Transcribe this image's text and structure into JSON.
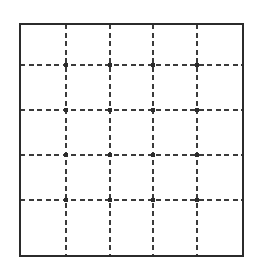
{
  "figure": {
    "kind": "dashed-grid-square",
    "canvas": {
      "width": 260,
      "height": 271,
      "background_color": "#ffffff"
    },
    "frame": {
      "name": "outer-square",
      "x": 20,
      "y": 24,
      "width": 223,
      "height": 232,
      "stroke_color": "#2b2b2b",
      "stroke_width": 2,
      "fill_color": "#ffffff",
      "line_style": "solid"
    },
    "grid": {
      "stroke_color": "#3a3a3a",
      "stroke_width": 1.6,
      "line_style": "dashed",
      "dash_length": 5,
      "dash_gap": 3.5,
      "columns": 5,
      "rows": 5,
      "vertical_lines": [
        {
          "name": "v-line-1",
          "x": 66
        },
        {
          "name": "v-line-2",
          "x": 110
        },
        {
          "name": "v-line-3",
          "x": 153
        },
        {
          "name": "v-line-4",
          "x": 197
        }
      ],
      "horizontal_lines": [
        {
          "name": "h-line-1",
          "y": 65
        },
        {
          "name": "h-line-2",
          "y": 110
        },
        {
          "name": "h-line-3",
          "y": 155
        },
        {
          "name": "h-line-4",
          "y": 200
        }
      ]
    },
    "intersections": {
      "name": "grid-node",
      "count": 16,
      "marker_shape": "dot",
      "marker_radius": 2.1,
      "marker_color": "#2b2b2b",
      "points": [
        {
          "x": 66,
          "y": 65
        },
        {
          "x": 110,
          "y": 65
        },
        {
          "x": 153,
          "y": 65
        },
        {
          "x": 197,
          "y": 65
        },
        {
          "x": 66,
          "y": 110
        },
        {
          "x": 110,
          "y": 110
        },
        {
          "x": 153,
          "y": 110
        },
        {
          "x": 197,
          "y": 110
        },
        {
          "x": 66,
          "y": 155
        },
        {
          "x": 110,
          "y": 155
        },
        {
          "x": 153,
          "y": 155
        },
        {
          "x": 197,
          "y": 155
        },
        {
          "x": 66,
          "y": 200
        },
        {
          "x": 110,
          "y": 200
        },
        {
          "x": 153,
          "y": 200
        },
        {
          "x": 197,
          "y": 200
        }
      ]
    },
    "labels": []
  }
}
